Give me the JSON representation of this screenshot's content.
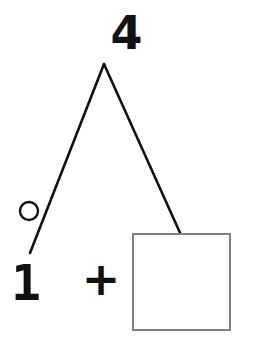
{
  "page": {
    "background_color": "#ffffff",
    "width": 253,
    "height": 360
  },
  "diagram": {
    "type": "number-bond",
    "title": "",
    "total": {
      "label": "4",
      "role": "whole"
    },
    "operator": {
      "label": "+",
      "name": "plus"
    },
    "parts": [
      {
        "label": "1",
        "role": "known-part",
        "marker": "circle"
      },
      {
        "label": "",
        "role": "unknown-part",
        "marker": "answer-box"
      }
    ],
    "marker": {
      "circle": {
        "cx": 29,
        "cy": 211,
        "r": 9,
        "stroke_color": "#111111",
        "stroke_width": 2.4,
        "fill": "none"
      },
      "answer_box": {
        "x": 133,
        "y": 234,
        "width": 97,
        "height": 96,
        "stroke_color": "#808080",
        "stroke_width": 2,
        "fill": "#ffffff"
      }
    },
    "branches": {
      "apex": {
        "x": 104,
        "y": 64
      },
      "left_end": {
        "x": 30,
        "y": 253
      },
      "right_end": {
        "x": 181,
        "y": 235
      },
      "stroke_color": "#111111",
      "stroke_width": 2.6
    }
  }
}
